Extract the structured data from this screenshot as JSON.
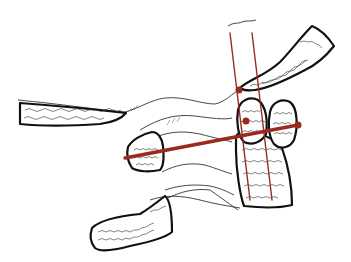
{
  "figure": {
    "type": "anatomical line illustration",
    "colors": {
      "background": "#ffffff",
      "outline": "#111111",
      "measurement_line": "#9b2a1e"
    },
    "elements": [
      {
        "name": "upper-left-long-bone",
        "description": "elongated bone with trabecular pattern, left"
      },
      {
        "name": "upper-right-long-bone",
        "description": "elongated bone with trabecular pattern, upper right"
      },
      {
        "name": "central-round-bone-left",
        "description": "rounded bone adjacent to joint"
      },
      {
        "name": "central-round-bone-right",
        "description": "oval bone right of joint"
      },
      {
        "name": "central-tall-bone",
        "description": "tall rectangular bone, center"
      },
      {
        "name": "small-left-bone",
        "description": "small bone at left end of horizontal axis"
      },
      {
        "name": "lower-left-bone",
        "description": "lower oblique bone with trabecular pattern"
      }
    ],
    "measurement_lines": [
      {
        "name": "vertical-axis-left",
        "from": [
          236,
          18
        ],
        "to": [
          260,
          200
        ]
      },
      {
        "name": "vertical-axis-right",
        "from": [
          257,
          18
        ],
        "to": [
          278,
          200
        ]
      },
      {
        "name": "horizontal-axis",
        "from": [
          125,
          157
        ],
        "to": [
          298,
          125
        ]
      }
    ],
    "marker_points": [
      {
        "name": "joint-point-upper",
        "x": 239,
        "y": 89
      },
      {
        "name": "joint-point-middle",
        "x": 246,
        "y": 120
      },
      {
        "name": "axis-end-right",
        "x": 298,
        "y": 125
      }
    ],
    "caption": ""
  }
}
